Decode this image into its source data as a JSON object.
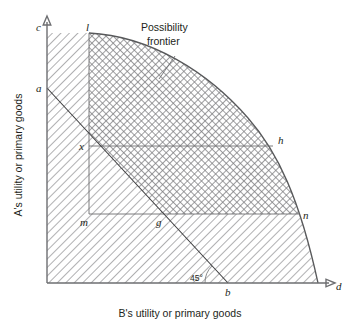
{
  "figure": {
    "title_note": "Possibility frontier",
    "note_line1": "Possibility",
    "note_line2": "frontier",
    "angle_label": "45°",
    "axes": {
      "y_label": "A's utility or primary goods",
      "x_label": "B's utility or primary goods",
      "y_arrow_tip_label": "c",
      "x_arrow_tip_label": "d"
    },
    "points": [
      {
        "id": "c",
        "label": "c",
        "x": 47,
        "y": 27,
        "desc": "top of vertical axis"
      },
      {
        "id": "l",
        "label": "l",
        "x": 89,
        "y": 30,
        "desc": "frontier top / vertical line top"
      },
      {
        "id": "a",
        "label": "a",
        "x": 41,
        "y": 90,
        "desc": "intercept of budget line on A axis"
      },
      {
        "id": "x",
        "label": "x",
        "x": 83,
        "y": 148,
        "desc": "allocation point x"
      },
      {
        "id": "h",
        "label": "h",
        "x": 278,
        "y": 145,
        "desc": "frontier point level with x"
      },
      {
        "id": "m",
        "label": "m",
        "x": 83,
        "y": 221,
        "desc": "lower-left corner of inner rectangle"
      },
      {
        "id": "g",
        "label": "g",
        "x": 158,
        "y": 221,
        "desc": "budget line crosses lower horizontal"
      },
      {
        "id": "n",
        "label": "n",
        "x": 303,
        "y": 218,
        "desc": "frontier point level with m and g"
      },
      {
        "id": "b",
        "label": "b",
        "x": 228,
        "y": 292,
        "desc": "budget line intercept on B axis"
      },
      {
        "id": "d",
        "label": "d",
        "x": 337,
        "y": 288,
        "desc": "tip of horizontal axis"
      }
    ],
    "colors": {
      "axis": "#6d6e71",
      "frontier": "#58595b",
      "budget_line": "#3b3b3d",
      "text": "#231f20",
      "hatch": "#8a8a8d",
      "background": "#ffffff"
    },
    "geometry": {
      "origin": [
        47,
        283
      ],
      "frontier_path": "M89,33 C150,36 208,72 248,118 C278,152 300,200 318,283",
      "budget_path": "M47,88 L228,283",
      "vertical_line": [
        89,
        33,
        89,
        214
      ],
      "horizontal_x_h": [
        89,
        146,
        272,
        146
      ],
      "horizontal_m_n": [
        89,
        214,
        299,
        214
      ],
      "leader_line": [
        173,
        58,
        159,
        78
      ]
    }
  }
}
